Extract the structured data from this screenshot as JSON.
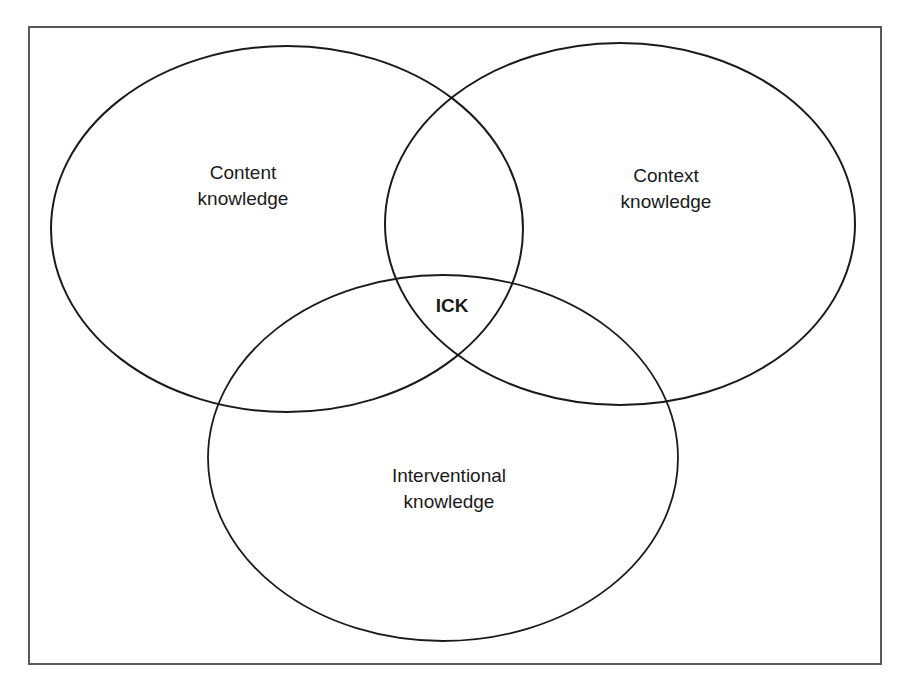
{
  "diagram": {
    "type": "venn",
    "sets": [
      {
        "id": "content",
        "label_line1": "Content",
        "label_line2": "knowledge"
      },
      {
        "id": "context",
        "label_line1": "Context",
        "label_line2": "knowledge"
      },
      {
        "id": "interventional",
        "label_line1": "Interventional",
        "label_line2": "knowledge"
      }
    ],
    "intersection": {
      "label": "ICK"
    },
    "colors": {
      "stroke": "#1a1a1a",
      "frame": "#5a5a5a",
      "background": "#ffffff"
    }
  }
}
